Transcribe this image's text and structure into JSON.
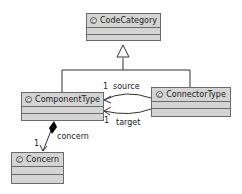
{
  "classes": {
    "code_category": {
      "name": "CodeCategory",
      "icon": "class-icon"
    },
    "component_type": {
      "name": "ComponentType",
      "icon": "class-icon"
    },
    "connector_type": {
      "name": "ConnectorType",
      "icon": "class-icon"
    },
    "concern": {
      "name": "Concern",
      "icon": "class-icon"
    }
  },
  "associations": {
    "source": {
      "role": "source",
      "multiplicity": "1"
    },
    "target": {
      "role": "target",
      "multiplicity": "1"
    },
    "concern": {
      "role": "concern",
      "multiplicity": "1"
    }
  },
  "icon_glyph": "C"
}
